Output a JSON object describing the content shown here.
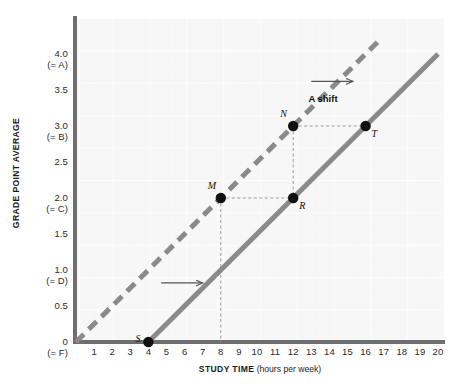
{
  "chart_data": {
    "type": "line",
    "title": "",
    "xlabel": "STUDY TIME (hours per week)",
    "ylabel": "GRADE POINT AVERAGE",
    "xlabel_main": "STUDY TIME",
    "xlabel_unit": "(hours per week)",
    "xlim": [
      0,
      20
    ],
    "ylim": [
      0,
      4.5
    ],
    "grid": true,
    "legend": "none",
    "x_ticks": [
      "1",
      "2",
      "3",
      "4",
      "5",
      "6",
      "7",
      "8",
      "9",
      "10",
      "11",
      "12",
      "13",
      "14",
      "15",
      "16",
      "17",
      "18",
      "19",
      "20"
    ],
    "x_tick_values": [
      1,
      2,
      3,
      4,
      5,
      6,
      7,
      8,
      9,
      10,
      11,
      12,
      13,
      14,
      15,
      16,
      17,
      18,
      19,
      20
    ],
    "y_ticks": [
      {
        "value": 4.0,
        "label": "4.0",
        "sublabel": "(= A)"
      },
      {
        "value": 3.5,
        "label": "3.5",
        "sublabel": ""
      },
      {
        "value": 3.0,
        "label": "3.0",
        "sublabel": "(= B)"
      },
      {
        "value": 2.5,
        "label": "2.5",
        "sublabel": ""
      },
      {
        "value": 2.0,
        "label": "2.0",
        "sublabel": "(= C)"
      },
      {
        "value": 1.5,
        "label": "1.5",
        "sublabel": ""
      },
      {
        "value": 1.0,
        "label": "1.0",
        "sublabel": "(= D)"
      },
      {
        "value": 0.5,
        "label": "0.5",
        "sublabel": ""
      },
      {
        "value": 0.0,
        "label": "0",
        "sublabel": "(= F)"
      }
    ],
    "series": [
      {
        "name": "original-line",
        "style": "dashed",
        "color": "#8a8a8a",
        "x_intercept": 0,
        "slope": 0.25,
        "points_x": [
          0,
          16.8
        ],
        "points_y": [
          0,
          4.2
        ]
      },
      {
        "name": "shifted-line",
        "style": "solid",
        "color": "#8a8a8a",
        "x_intercept": 4,
        "slope": 0.25,
        "points_x": [
          4,
          20
        ],
        "points_y": [
          0,
          4.0
        ]
      }
    ],
    "points": [
      {
        "id": "S",
        "label": "S",
        "x": 4,
        "y": 0.0,
        "label_pos": "left"
      },
      {
        "id": "M",
        "label": "M",
        "x": 8,
        "y": 2.0,
        "label_pos": "above-left"
      },
      {
        "id": "R",
        "label": "R",
        "x": 12,
        "y": 2.0,
        "label_pos": "below-right"
      },
      {
        "id": "N",
        "label": "N",
        "x": 12,
        "y": 3.0,
        "label_pos": "above-left"
      },
      {
        "id": "T",
        "label": "T",
        "x": 16,
        "y": 3.0,
        "label_pos": "below-right"
      }
    ],
    "annotations": [
      {
        "id": "shift-label",
        "text": "A shift",
        "x": 14.0,
        "y": 3.38
      },
      {
        "id": "shift-arrow-upper",
        "type": "arrow",
        "x1": 13.0,
        "y1": 3.62,
        "x2": 15.3,
        "y2": 3.62
      },
      {
        "id": "shift-arrow-lower",
        "type": "arrow",
        "x1": 4.7,
        "y1": 0.82,
        "x2": 7.0,
        "y2": 0.82
      }
    ],
    "guide_lines": [
      {
        "from": "M",
        "to": "R",
        "orientation": "horizontal"
      },
      {
        "from": "N",
        "to": "T",
        "orientation": "horizontal"
      },
      {
        "from": "M",
        "to": "x-axis",
        "orientation": "vertical"
      },
      {
        "from": "N",
        "to": "R",
        "orientation": "vertical"
      }
    ],
    "colors": {
      "plot_background": "#f7f7f7",
      "axis": "#6e6e6e",
      "line": "#8a8a8a",
      "point": "#111111",
      "guide": "#9a9a9a",
      "text": "#1a1a1a"
    }
  }
}
